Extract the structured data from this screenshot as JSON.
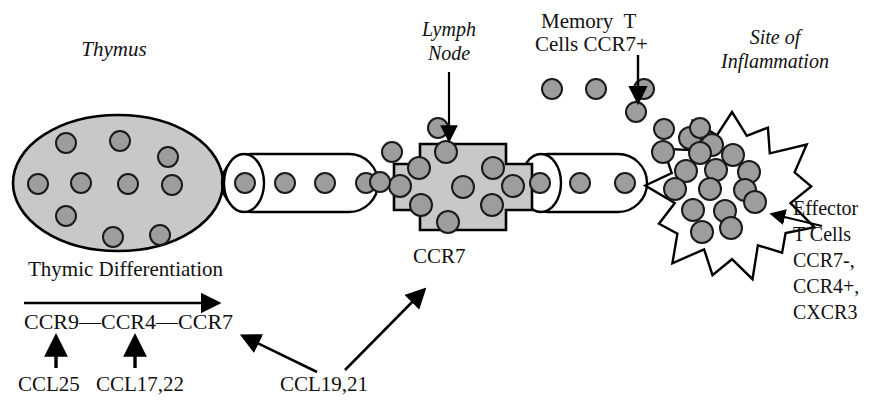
{
  "figure": {
    "title_alt": "T cell trafficking and chemokine receptor expression diagram",
    "background_color": "#ffffff",
    "cell_fill_color": "#9d9d9d",
    "cell_stroke_color": "#1a1a1a",
    "organ_fill_color": "#c8c8c8",
    "vessel_fill_color": "#ffffff",
    "stroke_color": "#000000"
  },
  "labels": {
    "thymus": "Thymus",
    "lymph_node_line1": "Lymph",
    "lymph_node_line2": "Node",
    "memory_line1": "Memory  T",
    "memory_line2": "Cells CCR7+",
    "site_line1": "Site of",
    "site_line2": "Inflammation",
    "ccr7_lymph": "CCR7",
    "thymic_differentiation": "Thymic Differentiation",
    "receptor_chain": "CCR9—CCR4—CCR7",
    "ccl25": "CCL25",
    "ccl17_22": "CCL17,22",
    "ccl19_21": "CCL19,21",
    "effector_line1": "Effector",
    "effector_line2": "T Cells",
    "effector_line3": "CCR7-,",
    "effector_line4": "CCR4+,",
    "effector_line5": "CXCR3"
  },
  "structures": {
    "thymus": {
      "name": "thymus-organ",
      "shape": "ellipse",
      "cx": 118,
      "cy": 183,
      "rx": 105,
      "ry": 68,
      "cells": [
        [
          66,
          143
        ],
        [
          120,
          141
        ],
        [
          168,
          157
        ],
        [
          38,
          184
        ],
        [
          81,
          183
        ],
        [
          128,
          184
        ],
        [
          172,
          185
        ],
        [
          66,
          216
        ],
        [
          113,
          237
        ],
        [
          160,
          235
        ]
      ]
    },
    "vessel_left": {
      "name": "lymphatic-vessel-left",
      "x": 222,
      "y": 154,
      "w": 156,
      "h": 58,
      "cap_rx": 20,
      "cap_ry": 29,
      "cells": [
        [
          245,
          183
        ],
        [
          285,
          183
        ],
        [
          325,
          183
        ],
        [
          366,
          183
        ]
      ]
    },
    "vessel_right": {
      "name": "lymphatic-vessel-right",
      "x": 519,
      "y": 154,
      "w": 128,
      "h": 58,
      "cap_rx": 20,
      "cap_ry": 29,
      "cells": [
        [
          540,
          183
        ],
        [
          580,
          183
        ],
        [
          625,
          183
        ]
      ]
    },
    "lymph_node": {
      "name": "lymph-node",
      "shape": "cross",
      "cx": 463,
      "cy": 187,
      "arm_w": 86,
      "arm_h": 86,
      "wing": 26,
      "wing_h": 46,
      "cells": [
        [
          446,
          152
        ],
        [
          419,
          168
        ],
        [
          493,
          168
        ],
        [
          400,
          186
        ],
        [
          463,
          187
        ],
        [
          513,
          186
        ],
        [
          421,
          205
        ],
        [
          492,
          205
        ],
        [
          448,
          222
        ]
      ]
    },
    "inflammation": {
      "name": "inflammation-site",
      "shape": "starburst",
      "cx": 732,
      "cy": 196,
      "r_outer": 84,
      "r_inner": 62,
      "points": 13,
      "cells": [
        [
          690,
          138
        ],
        [
          712,
          145
        ],
        [
          663,
          152
        ],
        [
          700,
          153
        ],
        [
          733,
          155
        ],
        [
          686,
          171
        ],
        [
          716,
          170
        ],
        [
          749,
          172
        ],
        [
          675,
          189
        ],
        [
          710,
          189
        ],
        [
          745,
          190
        ],
        [
          693,
          210
        ],
        [
          725,
          211
        ],
        [
          755,
          202
        ],
        [
          702,
          232
        ],
        [
          731,
          228
        ]
      ]
    },
    "free_cells": [
      [
        392,
        152
      ],
      [
        380,
        182
      ],
      [
        438,
        128
      ],
      [
        552,
        89
      ],
      [
        596,
        89
      ],
      [
        644,
        89
      ],
      [
        636,
        112
      ],
      [
        700,
        128
      ],
      [
        664,
        129
      ]
    ]
  },
  "arrows": {
    "lymph_node_pointer": {
      "name": "lymph-node-arrow",
      "x1": 449,
      "y1": 72,
      "x2": 449,
      "y2": 140
    },
    "memory_pointer": {
      "name": "memory-t-cells-arrow",
      "x1": 638,
      "y1": 55,
      "x2": 638,
      "y2": 102
    },
    "differentiation": {
      "name": "thymic-differentiation-arrow",
      "x1": 24,
      "y1": 303,
      "x2": 218,
      "y2": 303
    },
    "ccl25_pointer": {
      "name": "ccl25-arrow",
      "x1": 56,
      "y1": 368,
      "x2": 56,
      "y2": 337
    },
    "ccl17_pointer": {
      "name": "ccl17-22-arrow",
      "x1": 135,
      "y1": 368,
      "x2": 135,
      "y2": 337
    },
    "ccl19_left": {
      "name": "ccl19-21-left-arrow",
      "x1": 317,
      "y1": 372,
      "x2": 243,
      "y2": 336
    },
    "ccl19_right": {
      "name": "ccl19-21-right-arrow",
      "x1": 345,
      "y1": 370,
      "x2": 424,
      "y2": 290
    },
    "effector_pointer": {
      "name": "effector-t-cells-arrow",
      "x1": 822,
      "y1": 226,
      "x2": 772,
      "y2": 214
    }
  }
}
